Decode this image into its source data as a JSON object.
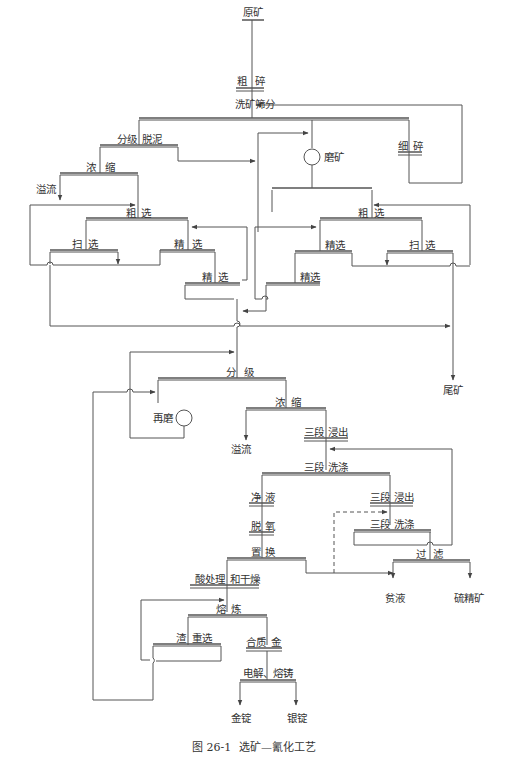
{
  "figure": {
    "caption_number": "图 26-1",
    "caption_title": "选矿—氰化工艺"
  },
  "nodes": {
    "raw_ore": "原矿",
    "coarse_crush_a": "粗",
    "coarse_crush_b": "碎",
    "wash_screen": "洗矿筛分",
    "classify_a": "分级",
    "classify_b": "脱泥",
    "fine_crush_a": "细",
    "fine_crush_b": "碎",
    "grinding": "磨矿",
    "thicken1_a": "浓",
    "thicken1_b": "缩",
    "overflow1": "溢流",
    "rougher_left_a": "粗",
    "rougher_left_b": "选",
    "scav_left_a": "扫",
    "scav_left_b": "选",
    "clean_left_a": "精",
    "clean_left_b": "选",
    "clean2_left_a": "精",
    "clean2_left_b": "选",
    "rougher_right_a": "粗",
    "rougher_right_b": "选",
    "clean_right": "精选",
    "scav_right_a": "扫",
    "scav_right_b": "选",
    "clean2_right": "精选",
    "tailings": "尾矿",
    "classify2_a": "分",
    "classify2_b": "级",
    "regrind": "再磨",
    "thicken2_a": "浓",
    "thicken2_b": "缩",
    "overflow2": "溢流",
    "leach3_a": "三段",
    "leach3_b": "浸出",
    "wash3_a": "三段",
    "wash3_b": "洗涤",
    "purify_a": "净",
    "purify_b": "液",
    "leach3b_a": "三段",
    "leach3b_b": "浸出",
    "deoxy_a": "脱",
    "deoxy_b": "氧",
    "wash3b_a": "三段",
    "wash3b_b": "洗涤",
    "replace_a": "置",
    "replace_b": "换",
    "filter_a": "过",
    "filter_b": "滤",
    "acid_a": "酸处理",
    "acid_b": "和干燥",
    "barren": "贫液",
    "sulfide_conc": "硫精矿",
    "smelt_a": "熔",
    "smelt_b": "炼",
    "slag_a": "渣",
    "slag_b": "重选",
    "alloy_a": "合质",
    "alloy_b": "金",
    "electro": "电解、熔铸",
    "gold": "金锭",
    "silver": "银锭"
  },
  "colors": {
    "line": "#555555",
    "text": "#333333"
  }
}
